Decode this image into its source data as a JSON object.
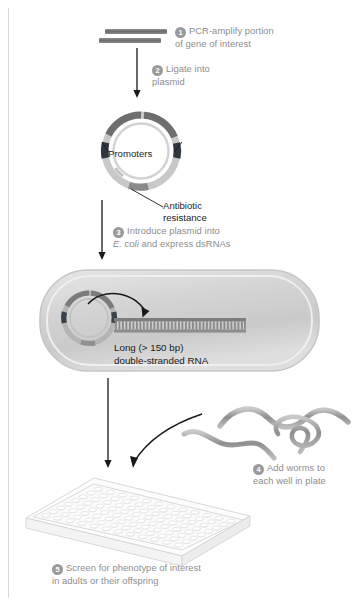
{
  "figure": {
    "accent_gray": "#8d8d8d",
    "dark": "#1a1a1a"
  },
  "steps": [
    {
      "num": "1",
      "line1": "PCR-amplify portion",
      "line2": "of gene of interest"
    },
    {
      "num": "2",
      "line1": "Ligate into",
      "line2": "plasmid"
    },
    {
      "num": "3",
      "line1": "Introduce plasmid into",
      "line2_italic": "E. coli",
      "line2_rest": " and express dsRNAs"
    },
    {
      "num": "4",
      "line1": "Add worms to",
      "line2": "each well in plate"
    },
    {
      "num": "5",
      "line1": "Screen for phenotype of interest",
      "line2": "in adults or their offspring"
    }
  ],
  "labels": {
    "promoters": "Promoters",
    "antibiotic_line1": "Antibiotic",
    "antibiotic_line2": "resistance",
    "dsrna_line1": "Long (> 150 bp)",
    "dsrna_line2": "double-stranded RNA"
  },
  "elements": {
    "pcr_product": "pcr-product-bars",
    "plasmid": "plasmid-ring",
    "bacterium": "e-coli-cell",
    "dsrna": "double-stranded-rna",
    "worms": "nematode-worms",
    "plate": "96-well-microplate"
  }
}
